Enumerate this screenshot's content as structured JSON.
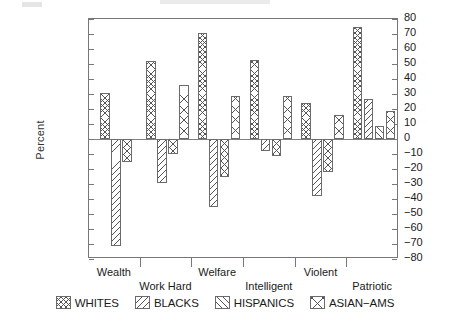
{
  "axis": {
    "ylabel": "Percent",
    "yticks": [
      80,
      70,
      60,
      50,
      40,
      30,
      20,
      10,
      0,
      -10,
      -20,
      -30,
      -40,
      -50,
      -60,
      -70,
      -80
    ],
    "ytick_labels": [
      "80",
      "70",
      "60",
      "50",
      "40",
      "30",
      "20",
      "10",
      "0",
      "−10",
      "−20",
      "−30",
      "−40",
      "−50",
      "−60",
      "−70",
      "−80"
    ]
  },
  "legend": {
    "items": [
      {
        "label": "WHITES",
        "pattern": "p-whites",
        "icon": "crosshatch-swatch-icon"
      },
      {
        "label": "BLACKS",
        "pattern": "p-blacks",
        "icon": "diagonal-down-swatch-icon"
      },
      {
        "label": "HISPANICS",
        "pattern": "p-hispanics",
        "icon": "diagonal-up-swatch-icon"
      },
      {
        "label": "ASIAN−AMS",
        "pattern": "p-asian",
        "icon": "cross-x-swatch-icon"
      }
    ]
  },
  "chart_data": {
    "type": "bar",
    "title": "",
    "xlabel": "",
    "ylabel": "Percent",
    "ylim": [
      -80,
      80
    ],
    "ytick_step": 10,
    "grid": false,
    "legend_position": "bottom",
    "orientation": "vertical",
    "dual_y_axis": true,
    "categories": [
      "Wealth",
      "Work Hard",
      "Welfare",
      "Intelligent",
      "Violent",
      "Patriotic"
    ],
    "series": [
      {
        "name": "WHITES",
        "values": [
          31,
          52,
          71,
          53,
          24,
          75
        ]
      },
      {
        "name": "BLACKS",
        "values": [
          -71,
          -29,
          -45,
          -8,
          -38,
          27
        ]
      },
      {
        "name": "HISPANICS",
        "values": [
          -15,
          -10,
          -25,
          -11,
          -22,
          9
        ]
      },
      {
        "name": "ASIAN−AMS",
        "values": [
          0,
          36,
          29,
          29,
          16,
          19
        ]
      }
    ]
  }
}
